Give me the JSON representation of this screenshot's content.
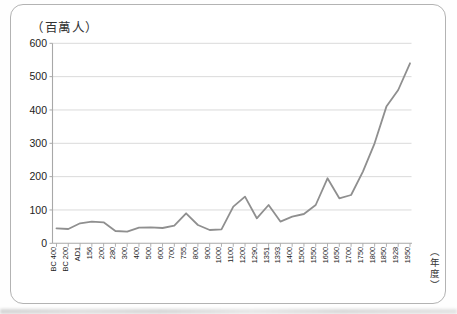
{
  "unit_label": "（百萬人）",
  "year_axis_label": "（年度）",
  "colors": {
    "line": "#8f8f8f",
    "grid": "#d6d6d6",
    "axis": "#a8a8a8",
    "tick_text": "#222222",
    "card_border": "#b3b3b3"
  },
  "chart_data": {
    "type": "line",
    "title": "",
    "ylabel": "（百萬人）",
    "xlabel": "（年度）",
    "ylim": [
      0,
      600
    ],
    "yticks": [
      0,
      100,
      200,
      300,
      400,
      500,
      600
    ],
    "grid": true,
    "legend": "none",
    "categories": [
      "BC 400",
      "BC 200",
      "AD1",
      "156",
      "200",
      "280",
      "300",
      "400",
      "500",
      "600",
      "700",
      "755",
      "800",
      "900",
      "1000",
      "1100",
      "1200",
      "1290",
      "1351",
      "1393",
      "1400",
      "1500",
      "1550",
      "1600",
      "1650",
      "1700",
      "1750",
      "1800",
      "1850",
      "1928",
      "1950"
    ],
    "values": [
      45,
      43,
      60,
      65,
      63,
      37,
      35,
      47,
      48,
      46,
      53,
      90,
      55,
      40,
      42,
      110,
      140,
      75,
      115,
      65,
      80,
      88,
      115,
      195,
      135,
      145,
      215,
      300,
      410,
      460,
      540
    ]
  }
}
